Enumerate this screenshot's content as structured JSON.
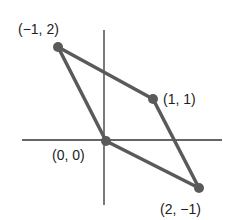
{
  "diagram": {
    "type": "parallelogram-on-axes",
    "axes": {
      "color": "#333333"
    },
    "shape": {
      "stroke": "#555555",
      "vertex_color": "#555555"
    },
    "vertices": [
      {
        "label": "(−1, 2)",
        "x": -1,
        "y": 2
      },
      {
        "label": "(1, 1)",
        "x": 1,
        "y": 1
      },
      {
        "label": "(2, −1)",
        "x": 2,
        "y": -1
      },
      {
        "label": "(0, 0)",
        "x": 0,
        "y": 0
      }
    ]
  }
}
